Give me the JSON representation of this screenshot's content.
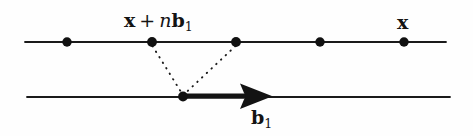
{
  "figure": {
    "name": "lattice-translation-diagram",
    "background_color": "#fefefe",
    "ink_color": "#141414",
    "width": 473,
    "height": 136
  },
  "labels": {
    "translated_point": {
      "full_text": "x + nb1",
      "vector_x": "x",
      "operator": "+",
      "scalar_n": "n",
      "vector_b": "b",
      "subscript": "1"
    },
    "origin_point": {
      "full_text": "x",
      "vector_x": "x"
    },
    "basis_vector": {
      "full_text": "b1",
      "vector_b": "b",
      "subscript": "1"
    }
  },
  "geometry": {
    "top_line": {
      "x1": 25,
      "y1": 42,
      "x2": 446,
      "y2": 42
    },
    "bottom_line": {
      "x1": 27,
      "y1": 97,
      "x2": 450,
      "y2": 97
    },
    "top_points": [
      {
        "cx": 67,
        "cy": 42,
        "r": 4.6
      },
      {
        "cx": 152,
        "cy": 42,
        "r": 4.8
      },
      {
        "cx": 236,
        "cy": 42,
        "r": 4.8
      },
      {
        "cx": 320,
        "cy": 42,
        "r": 4.6
      },
      {
        "cx": 404,
        "cy": 42,
        "r": 4.6
      }
    ],
    "bottom_points": [
      {
        "cx": 183,
        "cy": 97,
        "r": 4.8
      }
    ],
    "dotted_connectors": [
      {
        "x1": 152,
        "y1": 45,
        "x2": 182,
        "y2": 94
      },
      {
        "x1": 236,
        "y1": 45,
        "x2": 185,
        "y2": 94
      }
    ],
    "arrow": {
      "x1": 185,
      "y1": 96,
      "x2": 272,
      "y2": 96,
      "shaft_width": 5,
      "head_length": 30,
      "head_half_width": 13
    }
  }
}
